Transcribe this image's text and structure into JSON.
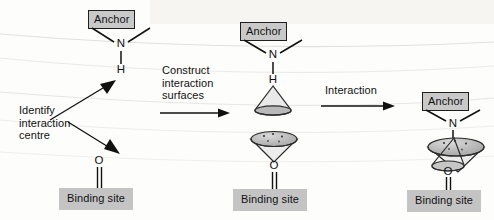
{
  "figure": {
    "background_color": "#fdfdfc",
    "box_fill_color": "#c9c9c9",
    "box_border_color": "#1f1f1f",
    "line_color": "#111111",
    "cone_fill_color": "#bdbdbd"
  },
  "stages": [
    {
      "id": "stage-1",
      "name": "identify",
      "anchor": {
        "label": "Anchor",
        "atoms": [
          {
            "symbol": "N",
            "name": "nitrogen-atom"
          },
          {
            "symbol": "H",
            "name": "hydrogen-atom"
          }
        ]
      },
      "binding": {
        "label": "Binding site",
        "atoms": [
          {
            "symbol": "O",
            "name": "oxygen-atom"
          }
        ]
      }
    },
    {
      "id": "stage-2",
      "name": "surfaces",
      "anchor": {
        "label": "Anchor",
        "atoms": [
          {
            "symbol": "N",
            "name": "nitrogen-atom"
          },
          {
            "symbol": "H",
            "name": "hydrogen-atom"
          }
        ]
      },
      "binding": {
        "label": "Binding site",
        "atoms": [
          {
            "symbol": "O",
            "name": "oxygen-atom"
          }
        ]
      }
    },
    {
      "id": "stage-3",
      "name": "interaction",
      "anchor": {
        "label": "Anchor",
        "atoms": [
          {
            "symbol": "N",
            "name": "nitrogen-atom"
          },
          {
            "symbol": "H",
            "name": "hydrogen-atom"
          }
        ]
      },
      "binding": {
        "label": "Binding site",
        "atoms": [
          {
            "symbol": "O",
            "name": "oxygen-atom"
          }
        ]
      }
    }
  ],
  "annotations": {
    "identify_interaction_centre": "Identify\ninteraction\ncentre",
    "construct_interaction_surfaces": "Construct\ninteraction\nsurfaces",
    "interaction": "Interaction"
  }
}
